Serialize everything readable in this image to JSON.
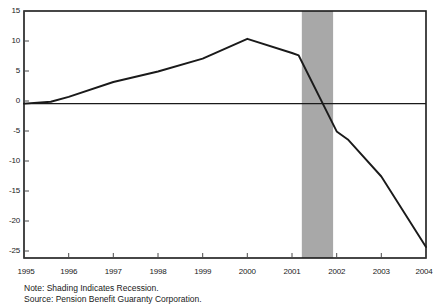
{
  "chart_data": {
    "type": "line",
    "title": "",
    "subtitle": "",
    "xlabel": "",
    "ylabel": "",
    "x": [
      1995,
      1996,
      1997,
      1998,
      1999,
      2000,
      2001,
      2002,
      2003,
      2004
    ],
    "xtick_labels": [
      "1995",
      "1996",
      "1997",
      "1998",
      "1999",
      "2000",
      "2001",
      "2002",
      "2003",
      "2004"
    ],
    "ytick_labels": [
      "15",
      "10",
      "5",
      "0",
      "-5",
      "-10",
      "-15",
      "-20",
      "-25"
    ],
    "ytick_values": [
      15,
      10,
      5,
      0,
      -5,
      -10,
      -15,
      -20,
      -25
    ],
    "ylim": [
      -25,
      15
    ],
    "xlim": [
      1995,
      2004
    ],
    "grid": false,
    "legend": "none",
    "series": [
      {
        "name": "PBGC Net Position",
        "color": "#1a1a1a",
        "values": [
          0.0,
          1.1,
          3.5,
          5.2,
          7.3,
          10.5,
          8.2,
          -4.5,
          -11.8,
          -23.2
        ],
        "detail_points": [
          {
            "x": 1995.0,
            "y": 0.0
          },
          {
            "x": 1995.6,
            "y": 0.3
          },
          {
            "x": 1996.0,
            "y": 1.1
          },
          {
            "x": 1997.0,
            "y": 3.5
          },
          {
            "x": 1998.0,
            "y": 5.2
          },
          {
            "x": 1999.0,
            "y": 7.3
          },
          {
            "x": 2000.0,
            "y": 10.5
          },
          {
            "x": 2001.0,
            "y": 8.2
          },
          {
            "x": 2001.15,
            "y": 7.8
          },
          {
            "x": 2002.0,
            "y": -4.5
          },
          {
            "x": 2002.25,
            "y": -5.8
          },
          {
            "x": 2003.0,
            "y": -11.8
          },
          {
            "x": 2004.0,
            "y": -23.2
          }
        ]
      }
    ],
    "zero_line": 0,
    "shaded_regions": [
      {
        "label": "Recession",
        "x_start": 2001.22,
        "x_end": 2001.92,
        "color": "#a8a8a8"
      }
    ],
    "annotations": {
      "note": "Note: Shading Indicates Recession.",
      "source": "Source: Pension Benefit Guaranty Corporation."
    },
    "axis_color": "#1a1a1a",
    "background": "#ffffff"
  }
}
